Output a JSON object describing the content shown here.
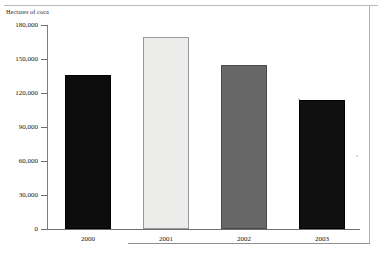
{
  "chart_data": {
    "type": "bar",
    "title": "",
    "ylabel": "Hectares of coca",
    "xlabel": "",
    "categories": [
      "2000",
      "2001",
      "2002",
      "2003"
    ],
    "values": [
      136200,
      169800,
      144450,
      113850
    ],
    "series": [
      {
        "name": "Hectares of coca",
        "values": [
          136200,
          169800,
          144450,
          113850
        ]
      }
    ],
    "ylim": [
      0,
      180000
    ],
    "y_ticks": [
      {
        "value": 180000,
        "label": "180,000"
      },
      {
        "value": 150000,
        "label": "150,000"
      },
      {
        "value": 120000,
        "label": "120,000"
      },
      {
        "value": 90000,
        "label": "90,000"
      },
      {
        "value": 60000,
        "label": "60,000"
      },
      {
        "value": 30000,
        "label": "30,000"
      },
      {
        "value": 0,
        "label": "0"
      }
    ],
    "bar_fills": [
      "#0d0d0d",
      "#ececeb",
      "#676767",
      "#101010"
    ],
    "bar_borders": [
      "#000000",
      "#9a9a9a",
      "#4a4a4a",
      "#000000"
    ],
    "grid": false,
    "legend": "none"
  },
  "axis": {
    "y_title": "Hectares of coca",
    "axis_color": "#6e6e6e",
    "frame_color": "#b0b0b0"
  }
}
